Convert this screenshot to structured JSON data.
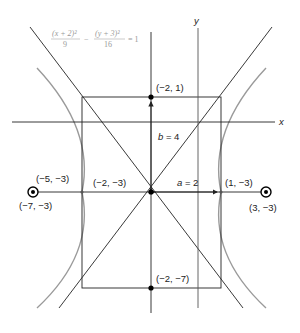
{
  "diagram": {
    "type": "hyperbola",
    "equation": {
      "num1": "(x + 2)²",
      "den1": "9",
      "minus": "−",
      "num2": "(y + 3)²",
      "den2": "16",
      "rhs": "= 1"
    },
    "axes": {
      "x_label": "x",
      "y_label": "y"
    },
    "points": {
      "top": "(−2, 1)",
      "bottom": "(−2, −7)",
      "center": "(−2, −3)",
      "left_vertex": "(−5, −3)",
      "right_vertex": "(1, −3)",
      "left_focus": "(−7, −3)",
      "right_focus": "(3, −3)"
    },
    "annotations": {
      "b": "b = 4",
      "a": "a = 2"
    },
    "colors": {
      "curve": "#9a9a9a",
      "line": "#222222",
      "equation": "#999999"
    }
  }
}
